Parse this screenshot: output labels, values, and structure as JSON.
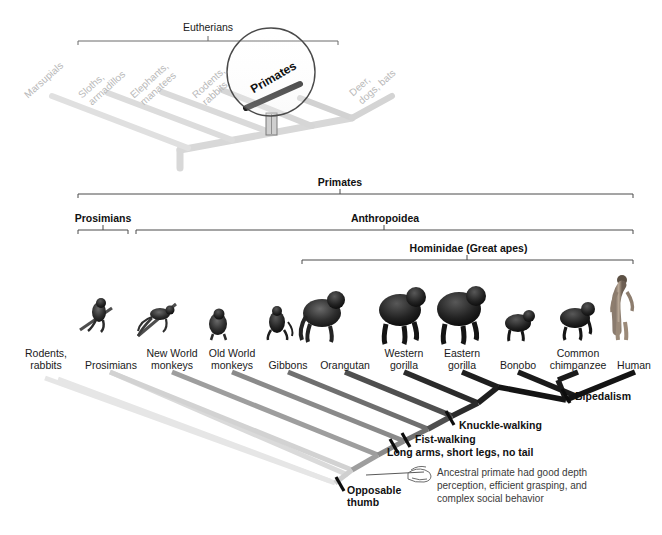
{
  "figure": {
    "title_top_bracket": "Eutherians",
    "magnifier_label": "Primates"
  },
  "top_tree": {
    "taxa": [
      {
        "name": "Marsupials"
      },
      {
        "name": "Sloths,"
      },
      {
        "name": "armadillos"
      },
      {
        "name": "Elephants,"
      },
      {
        "name": "manatees"
      },
      {
        "name": "Rodents,"
      },
      {
        "name": "rabbits"
      },
      {
        "name": "Deer,"
      },
      {
        "name": "dogs, bats"
      }
    ]
  },
  "brackets": [
    {
      "label": "Primates"
    },
    {
      "label": "Prosimians"
    },
    {
      "label": "Anthropoidea"
    },
    {
      "label": "Hominidae (Great apes)"
    }
  ],
  "tips": [
    {
      "line1": "Rodents,",
      "line2": "rabbits"
    },
    {
      "line1": "Prosimians",
      "line2": ""
    },
    {
      "line1": "New World",
      "line2": "monkeys"
    },
    {
      "line1": "Old World",
      "line2": "monkeys"
    },
    {
      "line1": "Gibbons",
      "line2": ""
    },
    {
      "line1": "Orangutan",
      "line2": ""
    },
    {
      "line1": "Western",
      "line2": "gorilla"
    },
    {
      "line1": "Eastern",
      "line2": "gorilla"
    },
    {
      "line1": "Bonobo",
      "line2": ""
    },
    {
      "line1": "Common",
      "line2": "chimpanzee"
    },
    {
      "line1": "Human",
      "line2": ""
    }
  ],
  "traits": [
    {
      "label": "Bipedalism"
    },
    {
      "label": "Knuckle-walking"
    },
    {
      "label": "Fist-walking"
    },
    {
      "label": "Long arms, short legs, no tail"
    },
    {
      "label": "Opposable"
    },
    {
      "label": "thumb"
    }
  ],
  "caption": {
    "line1": "Ancestral primate had good depth",
    "line2": "perception, efficient grasping, and",
    "line3": "complex social behavior"
  },
  "colors": {
    "branch_lightest": "#e3e3e3",
    "branch_light": "#cfcfcf",
    "branch_mid": "#9a9a9a",
    "branch_dark": "#6e6e6e",
    "branch_darker": "#4a4a4a",
    "branch_black": "#1c1c1c",
    "faded_tree": "#d8d8d8",
    "faded_text": "#b9b9b9",
    "bracket": "#4a4a4a",
    "text": "#1a1a1a"
  }
}
